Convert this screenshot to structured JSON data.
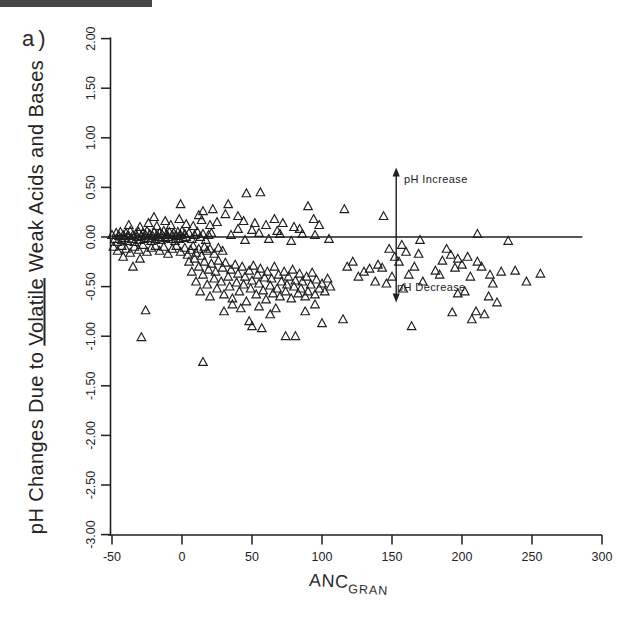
{
  "figure": {
    "panel_label": "a)",
    "background": "#ffffff",
    "ink_color": "#1f1f1f"
  },
  "chart_data": {
    "type": "scatter",
    "title": "",
    "xlabel_main": "ANC",
    "xlabel_subscript": "GRAN",
    "ylabel_parts": {
      "prefix": "pH Changes Due to ",
      "underlined": "Volatile",
      "suffix": " Weak Acids and Bases"
    },
    "xlim": [
      -50,
      300
    ],
    "ylim": [
      -3.0,
      2.0
    ],
    "x_ticks": [
      "-50",
      "0",
      "50",
      "100",
      "150",
      "200",
      "250",
      "300"
    ],
    "y_ticks": [
      "2.00",
      "1.50",
      "1.00",
      "0.50",
      "0.00",
      "-0.50",
      "-1.00",
      "-1.50",
      "-2.00",
      "-2.50",
      "-3.00"
    ],
    "grid": false,
    "legend": null,
    "marker": {
      "shape": "open-triangle-up",
      "size_px": 9,
      "color": "#1f1f1f"
    },
    "zero_line": {
      "y": 0.0,
      "x_start": -50,
      "x_end": 286
    },
    "annotation": {
      "x": 153,
      "arrow_top_y": 0.7,
      "arrow_bottom_y": -0.66,
      "increase_label": "pH Increase",
      "decrease_label": "pH Decrease"
    },
    "points": [
      [
        -50,
        0.02
      ],
      [
        -48,
        -0.02
      ],
      [
        -47,
        0.04
      ],
      [
        -46,
        -0.05
      ],
      [
        -45,
        0.01
      ],
      [
        -44,
        0.05
      ],
      [
        -43,
        -0.03
      ],
      [
        -42,
        0.02
      ],
      [
        -41,
        -0.01
      ],
      [
        -40,
        0.04
      ],
      [
        -39,
        -0.04
      ],
      [
        -38,
        0.01
      ],
      [
        -37,
        0.06
      ],
      [
        -36,
        -0.02
      ],
      [
        -35,
        0.02
      ],
      [
        -34,
        -0.05
      ],
      [
        -33,
        0.03
      ],
      [
        -32,
        0.0
      ],
      [
        -31,
        0.05
      ],
      [
        -30,
        -0.03
      ],
      [
        -29,
        0.01
      ],
      [
        -28,
        0.04
      ],
      [
        -27,
        -0.02
      ],
      [
        -26,
        0.02
      ],
      [
        -25,
        0.06
      ],
      [
        -24,
        -0.01
      ],
      [
        -23,
        0.03
      ],
      [
        -22,
        -0.04
      ],
      [
        -21,
        0.01
      ],
      [
        -20,
        0.05
      ],
      [
        -19,
        -0.02
      ],
      [
        -18,
        0.02
      ],
      [
        -17,
        0.0
      ],
      [
        -16,
        0.04
      ],
      [
        -15,
        -0.03
      ],
      [
        -14,
        0.02
      ],
      [
        -13,
        0.06
      ],
      [
        -12,
        -0.01
      ],
      [
        -11,
        0.03
      ],
      [
        -10,
        0.0
      ],
      [
        -9,
        0.05
      ],
      [
        -8,
        -0.02
      ],
      [
        -7,
        0.02
      ],
      [
        -6,
        0.04
      ],
      [
        -5,
        -0.04
      ],
      [
        -4,
        0.01
      ],
      [
        -3,
        0.05
      ],
      [
        -2,
        -0.02
      ],
      [
        -1,
        0.02
      ],
      [
        0,
        0.06
      ],
      [
        1,
        -0.01
      ],
      [
        2,
        0.03
      ],
      [
        3,
        0.0
      ],
      [
        5,
        0.04
      ],
      [
        7,
        -0.02
      ],
      [
        9,
        0.02
      ],
      [
        11,
        0.05
      ],
      [
        13,
        0.0
      ],
      [
        15,
        0.03
      ],
      [
        17,
        -0.03
      ],
      [
        19,
        0.02
      ],
      [
        21,
        0.04
      ],
      [
        -49,
        -0.1
      ],
      [
        -46,
        -0.14
      ],
      [
        -43,
        -0.09
      ],
      [
        -40,
        -0.12
      ],
      [
        -37,
        -0.16
      ],
      [
        -34,
        -0.1
      ],
      [
        -31,
        -0.13
      ],
      [
        -28,
        -0.08
      ],
      [
        -25,
        -0.15
      ],
      [
        -22,
        -0.11
      ],
      [
        -19,
        -0.09
      ],
      [
        -16,
        -0.14
      ],
      [
        -13,
        -0.1
      ],
      [
        -10,
        -0.17
      ],
      [
        -7,
        -0.12
      ],
      [
        -4,
        -0.09
      ],
      [
        -1,
        -0.15
      ],
      [
        2,
        -0.11
      ],
      [
        4,
        -0.18
      ],
      [
        6,
        -0.13
      ],
      [
        8,
        -0.09
      ],
      [
        10,
        -0.16
      ],
      [
        12,
        -0.12
      ],
      [
        14,
        -0.19
      ],
      [
        16,
        -0.1
      ],
      [
        18,
        -0.14
      ],
      [
        20,
        -0.12
      ],
      [
        23,
        -0.17
      ],
      [
        26,
        -0.11
      ],
      [
        29,
        -0.14
      ],
      [
        -38,
        0.12
      ],
      [
        -30,
        0.1
      ],
      [
        -24,
        0.14
      ],
      [
        -18,
        0.11
      ],
      [
        -12,
        0.16
      ],
      [
        -8,
        0.12
      ],
      [
        -2,
        0.18
      ],
      [
        3,
        0.13
      ],
      [
        8,
        0.11
      ],
      [
        14,
        0.17
      ],
      [
        20,
        0.12
      ],
      [
        25,
        0.15
      ],
      [
        -1,
        0.33
      ],
      [
        15,
        0.26
      ],
      [
        31,
        0.23
      ],
      [
        33,
        0.33
      ],
      [
        46,
        0.44
      ],
      [
        56,
        0.45
      ],
      [
        44,
        0.16
      ],
      [
        52,
        0.14
      ],
      [
        66,
        0.18
      ],
      [
        90,
        0.31
      ],
      [
        94,
        0.18
      ],
      [
        12,
        0.22
      ],
      [
        22,
        0.28
      ],
      [
        -20,
        0.2
      ],
      [
        40,
        0.21
      ],
      [
        60,
        0.12
      ],
      [
        72,
        0.14
      ],
      [
        80,
        0.1
      ],
      [
        98,
        0.12
      ],
      [
        116,
        0.28
      ],
      [
        144,
        0.21
      ],
      [
        -29,
        -1.01
      ],
      [
        -26,
        -0.74
      ],
      [
        -35,
        -0.3
      ],
      [
        -30,
        -0.22
      ],
      [
        -42,
        -0.2
      ],
      [
        15,
        -1.26
      ],
      [
        5,
        -0.25
      ],
      [
        7,
        -0.35
      ],
      [
        9,
        -0.22
      ],
      [
        10,
        -0.45
      ],
      [
        12,
        -0.3
      ],
      [
        13,
        -0.55
      ],
      [
        15,
        -0.38
      ],
      [
        16,
        -0.25
      ],
      [
        18,
        -0.48
      ],
      [
        19,
        -0.33
      ],
      [
        20,
        -0.6
      ],
      [
        21,
        -0.27
      ],
      [
        23,
        -0.42
      ],
      [
        24,
        -0.35
      ],
      [
        25,
        -0.52
      ],
      [
        26,
        -0.24
      ],
      [
        28,
        -0.45
      ],
      [
        29,
        -0.31
      ],
      [
        30,
        -0.58
      ],
      [
        31,
        -0.26
      ],
      [
        33,
        -0.4
      ],
      [
        34,
        -0.5
      ],
      [
        35,
        -0.33
      ],
      [
        36,
        -0.62
      ],
      [
        38,
        -0.28
      ],
      [
        39,
        -0.46
      ],
      [
        40,
        -0.37
      ],
      [
        41,
        -0.55
      ],
      [
        43,
        -0.3
      ],
      [
        44,
        -0.48
      ],
      [
        45,
        -0.4
      ],
      [
        46,
        -0.65
      ],
      [
        48,
        -0.34
      ],
      [
        49,
        -0.52
      ],
      [
        50,
        -0.44
      ],
      [
        51,
        -0.29
      ],
      [
        53,
        -0.58
      ],
      [
        54,
        -0.38
      ],
      [
        55,
        -0.47
      ],
      [
        56,
        -0.32
      ],
      [
        58,
        -0.54
      ],
      [
        59,
        -0.41
      ],
      [
        60,
        -0.63
      ],
      [
        61,
        -0.35
      ],
      [
        63,
        -0.49
      ],
      [
        64,
        -0.42
      ],
      [
        65,
        -0.57
      ],
      [
        66,
        -0.3
      ],
      [
        68,
        -0.52
      ],
      [
        69,
        -0.38
      ],
      [
        70,
        -0.6
      ],
      [
        71,
        -0.45
      ],
      [
        73,
        -0.35
      ],
      [
        74,
        -0.55
      ],
      [
        75,
        -0.48
      ],
      [
        76,
        -0.4
      ],
      [
        78,
        -0.62
      ],
      [
        79,
        -0.33
      ],
      [
        80,
        -0.5
      ],
      [
        81,
        -0.44
      ],
      [
        83,
        -0.57
      ],
      [
        84,
        -0.37
      ],
      [
        85,
        -0.52
      ],
      [
        86,
        -0.45
      ],
      [
        88,
        -0.6
      ],
      [
        89,
        -0.4
      ],
      [
        90,
        -0.55
      ],
      [
        92,
        -0.48
      ],
      [
        93,
        -0.36
      ],
      [
        95,
        -0.58
      ],
      [
        96,
        -0.43
      ],
      [
        98,
        -0.52
      ],
      [
        100,
        -0.47
      ],
      [
        102,
        -0.55
      ],
      [
        104,
        -0.42
      ],
      [
        106,
        -0.5
      ],
      [
        48,
        -0.85
      ],
      [
        50,
        -0.9
      ],
      [
        57,
        -0.92
      ],
      [
        74,
        -1.0
      ],
      [
        81,
        -1.0
      ],
      [
        100,
        -0.87
      ],
      [
        63,
        -0.78
      ],
      [
        42,
        -0.72
      ],
      [
        30,
        -0.75
      ],
      [
        36,
        -0.68
      ],
      [
        55,
        -0.7
      ],
      [
        67,
        -0.72
      ],
      [
        88,
        -0.75
      ],
      [
        95,
        -0.68
      ],
      [
        35,
        0.02
      ],
      [
        45,
        -0.03
      ],
      [
        55,
        0.04
      ],
      [
        62,
        -0.02
      ],
      [
        70,
        0.03
      ],
      [
        78,
        -0.04
      ],
      [
        86,
        0.03
      ],
      [
        95,
        0.02
      ],
      [
        105,
        -0.02
      ],
      [
        40,
        0.08
      ],
      [
        50,
        0.07
      ],
      [
        68,
        0.06
      ],
      [
        84,
        0.08
      ],
      [
        115,
        -0.83
      ],
      [
        118,
        -0.3
      ],
      [
        122,
        -0.25
      ],
      [
        126,
        -0.4
      ],
      [
        130,
        -0.35
      ],
      [
        134,
        -0.32
      ],
      [
        138,
        -0.45
      ],
      [
        140,
        -0.28
      ],
      [
        143,
        -0.31
      ],
      [
        146,
        -0.47
      ],
      [
        150,
        -0.4
      ],
      [
        155,
        -0.25
      ],
      [
        158,
        -0.52
      ],
      [
        162,
        -0.38
      ],
      [
        164,
        -0.9
      ],
      [
        166,
        -0.3
      ],
      [
        170,
        -0.03
      ],
      [
        169,
        -0.17
      ],
      [
        172,
        -0.45
      ],
      [
        148,
        -0.12
      ],
      [
        152,
        -0.2
      ],
      [
        160,
        -0.15
      ],
      [
        157,
        -0.08
      ],
      [
        211,
        0.03
      ],
      [
        233,
        -0.04
      ],
      [
        181,
        -0.34
      ],
      [
        184,
        -0.38
      ],
      [
        186,
        -0.24
      ],
      [
        189,
        -0.12
      ],
      [
        192,
        -0.18
      ],
      [
        195,
        -0.31
      ],
      [
        193,
        -0.76
      ],
      [
        197,
        -0.22
      ],
      [
        197,
        -0.57
      ],
      [
        200,
        -0.28
      ],
      [
        202,
        -0.55
      ],
      [
        204,
        -0.2
      ],
      [
        206,
        -0.4
      ],
      [
        207,
        -0.83
      ],
      [
        210,
        -0.75
      ],
      [
        211,
        -0.25
      ],
      [
        214,
        -0.3
      ],
      [
        216,
        -0.78
      ],
      [
        219,
        -0.6
      ],
      [
        220,
        -0.38
      ],
      [
        222,
        -0.47
      ],
      [
        225,
        -0.66
      ],
      [
        228,
        -0.35
      ],
      [
        238,
        -0.34
      ],
      [
        246,
        -0.45
      ],
      [
        256,
        -0.37
      ]
    ]
  }
}
